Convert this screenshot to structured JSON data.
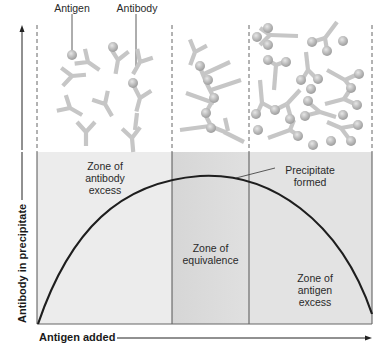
{
  "figure": {
    "type": "precipitin-curve-diagram",
    "labels": {
      "antigen": "Antigen",
      "antibody": "Antibody",
      "precipitate_line1": "Precipitate",
      "precipitate_line2": "formed"
    },
    "zones": [
      {
        "id": "antibody-excess",
        "line1": "Zone of",
        "line2": "antibody",
        "line3": "excess"
      },
      {
        "id": "equivalence",
        "line1": "Zone of",
        "line2": "equivalence"
      },
      {
        "id": "antigen-excess",
        "line1": "Zone of",
        "line2": "antigen",
        "line3": "excess"
      }
    ],
    "axes": {
      "x_label": "Antigen added",
      "y_label": "Antibody in precipitate"
    },
    "colors": {
      "zone_left_fill": "#ececec",
      "zone_middle_fill": "#dcdcdc",
      "zone_right_fill": "#e2e2e2",
      "curve": "#1e1e1e",
      "molecule": "#c4c4c4",
      "antigen_ball": "#b8b8b8",
      "divider": "#555555"
    }
  }
}
